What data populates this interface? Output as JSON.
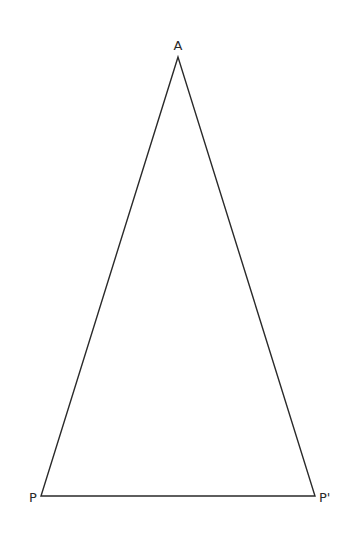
{
  "diagram": {
    "type": "triangle",
    "stroke_color": "#2a2a2a",
    "vertices": {
      "apex": {
        "label": "A",
        "x": 178,
        "y": 57
      },
      "left": {
        "label": "P",
        "x": 41,
        "y": 496
      },
      "right": {
        "label": "P'",
        "x": 315,
        "y": 496
      }
    }
  }
}
